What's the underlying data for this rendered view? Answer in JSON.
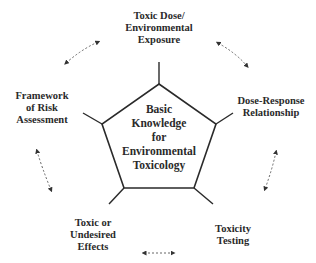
{
  "diagram": {
    "type": "cycle-pentagon",
    "center": {
      "lines": [
        "Basic",
        "Knowledge",
        "for",
        "Environmental",
        "Toxicology"
      ]
    },
    "nodes": [
      {
        "id": "top",
        "lines": [
          "Toxic Dose/",
          "Environmental",
          "Exposure"
        ]
      },
      {
        "id": "right",
        "lines": [
          "Dose-Response",
          "Relationship"
        ]
      },
      {
        "id": "bottom-right",
        "lines": [
          "Toxicity",
          "Testing"
        ]
      },
      {
        "id": "bottom-left",
        "lines": [
          "Toxic or",
          "Undesired",
          "Effects"
        ]
      },
      {
        "id": "left",
        "lines": [
          "Framework",
          "of Risk",
          "Assessment"
        ]
      }
    ],
    "connectors": [
      {
        "from": "left",
        "to": "top",
        "style": "dashed-double-arrow"
      },
      {
        "from": "top",
        "to": "right",
        "style": "dashed-double-arrow"
      },
      {
        "from": "right",
        "to": "bottom-right",
        "style": "dashed-double-arrow"
      },
      {
        "from": "bottom-right",
        "to": "bottom-left",
        "style": "dashed-double-arrow"
      },
      {
        "from": "bottom-left",
        "to": "left",
        "style": "dashed-double-arrow"
      }
    ],
    "colors": {
      "line": "#2a2a2a",
      "text": "#2a2a2a",
      "arrow": "#555555",
      "background": "#ffffff"
    }
  }
}
